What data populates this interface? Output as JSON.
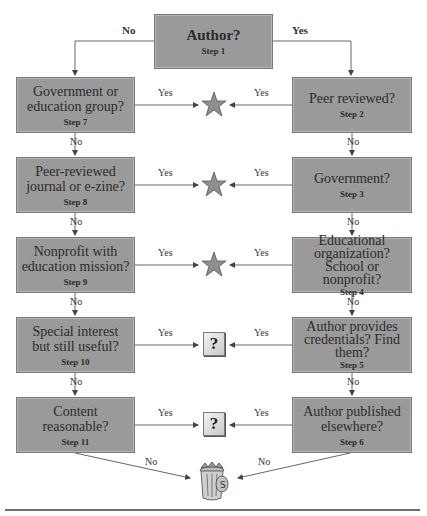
{
  "diagram": {
    "start": {
      "question": "Author?",
      "step": "Step 1"
    },
    "branch_labels": {
      "no": "No",
      "yes": "Yes"
    },
    "left_column": [
      {
        "question": "Government or education group?",
        "step": "Step 7",
        "yes_outcome": "star",
        "no_label": "No"
      },
      {
        "question": "Peer-reviewed journal or e-zine?",
        "step": "Step 8",
        "yes_outcome": "star",
        "no_label": "No"
      },
      {
        "question": "Nonprofit with education mission?",
        "step": "Step 9",
        "yes_outcome": "star",
        "no_label": "No"
      },
      {
        "question": "Special interest but still useful?",
        "step": "Step 10",
        "yes_outcome": "question",
        "no_label": "No"
      },
      {
        "question": "Content reasonable?",
        "step": "Step 11",
        "yes_outcome": "question",
        "no_label": "No"
      }
    ],
    "right_column": [
      {
        "question": "Peer reviewed?",
        "step": "Step 2",
        "yes_outcome": "star",
        "no_label": "No"
      },
      {
        "question": "Government?",
        "step": "Step 3",
        "yes_outcome": "star",
        "no_label": "No"
      },
      {
        "question": "Educational organization? School or nonprofit?",
        "step": "Step 4",
        "yes_outcome": "star",
        "no_label": "No"
      },
      {
        "question": "Author provides credentials? Find them?",
        "step": "Step 5",
        "yes_outcome": "question",
        "no_label": "No"
      },
      {
        "question": "Author published elsewhere?",
        "step": "Step 6",
        "yes_outcome": "question",
        "no_label": "No"
      }
    ],
    "edge_labels": {
      "yes": "Yes",
      "no": "No"
    },
    "outcomes": {
      "star": {
        "icon": "star-icon",
        "meaning": "reliable"
      },
      "question": {
        "icon": "question-mark-icon",
        "glyph": "?"
      },
      "trash": {
        "icon": "trash-can-icon"
      }
    },
    "colors": {
      "box_fill": "#9a9a9a",
      "star_fill": "#8f8f8f",
      "line": "#555555"
    }
  }
}
